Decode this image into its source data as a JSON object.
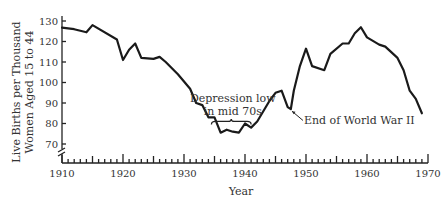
{
  "chart_data": {
    "type": "line",
    "title": "",
    "xlabel": "Year",
    "ylabel": [
      "Live Births per Thousand",
      "Women Aged 15 to 44"
    ],
    "xlim": [
      1910,
      1970
    ],
    "ylim": [
      70,
      130
    ],
    "x_ticks": [
      1910,
      1920,
      1930,
      1940,
      1950,
      1960,
      1970
    ],
    "x_tick_labels": [
      "1910",
      "1920",
      "1930",
      "1940",
      "1950",
      "1960",
      "1970"
    ],
    "x_minor_tick_step": 1,
    "y_ticks": [
      70,
      80,
      90,
      100,
      110,
      120,
      130
    ],
    "y_tick_labels": [
      "70",
      "80",
      "90",
      "100",
      "110",
      "120",
      "130"
    ],
    "y_axis_break": true,
    "grid": false,
    "legend": null,
    "series": [
      {
        "name": "Birth rate",
        "color": "#1a1a1a",
        "points": [
          [
            1910,
            126.8
          ],
          [
            1912,
            126.0
          ],
          [
            1914,
            124.5
          ],
          [
            1915,
            128.0
          ],
          [
            1919,
            121.0
          ],
          [
            1920,
            111.0
          ],
          [
            1921,
            116.0
          ],
          [
            1922,
            119.0
          ],
          [
            1923,
            112.0
          ],
          [
            1925,
            111.5
          ],
          [
            1926,
            112.5
          ],
          [
            1927,
            110.0
          ],
          [
            1929,
            104.0
          ],
          [
            1931,
            97.0
          ],
          [
            1932,
            90.0
          ],
          [
            1933,
            89.0
          ],
          [
            1934,
            83.0
          ],
          [
            1935,
            83.0
          ],
          [
            1936,
            75.5
          ],
          [
            1937,
            77.0
          ],
          [
            1938,
            76.0
          ],
          [
            1939,
            75.5
          ],
          [
            1940,
            80.0
          ],
          [
            1941,
            78.0
          ],
          [
            1942,
            81.0
          ],
          [
            1944,
            91.0
          ],
          [
            1945,
            95.0
          ],
          [
            1946,
            96.0
          ],
          [
            1947,
            88.0
          ],
          [
            1947.5,
            87.0
          ],
          [
            1948,
            96.0
          ],
          [
            1949,
            108.0
          ],
          [
            1950,
            116.5
          ],
          [
            1951,
            108.0
          ],
          [
            1953,
            106.0
          ],
          [
            1954,
            114.0
          ],
          [
            1956,
            119.0
          ],
          [
            1957,
            119.0
          ],
          [
            1958,
            124.0
          ],
          [
            1959,
            127.0
          ],
          [
            1960,
            122.0
          ],
          [
            1962,
            118.5
          ],
          [
            1963,
            117.5
          ],
          [
            1965,
            112.0
          ],
          [
            1966,
            106.0
          ],
          [
            1967,
            96.0
          ],
          [
            1968,
            92.0
          ],
          [
            1969,
            85.0
          ]
        ]
      }
    ],
    "annotations": [
      {
        "name": "depression-low",
        "text": [
          "Depression low",
          "in mid 70s"
        ],
        "brace_x": [
          1934.5,
          1941
        ],
        "brace_y": 81,
        "anchor_year": 1938
      },
      {
        "name": "end-of-wwii",
        "text": "End of World War II",
        "arrow_from": [
          1949.5,
          81.5
        ],
        "arrow_to": [
          1947.7,
          86.0
        ]
      }
    ]
  }
}
